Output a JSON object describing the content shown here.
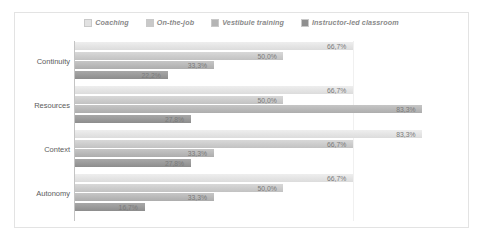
{
  "chart_data": {
    "type": "bar",
    "orientation": "horizontal",
    "title": "",
    "xlabel": "",
    "ylabel": "",
    "grid": true,
    "legend_position": "top",
    "xlim": [
      0,
      100
    ],
    "decimal_separator": ",",
    "value_suffix": "%",
    "categories": [
      "Continuity",
      "Resources",
      "Context",
      "Autonomy"
    ],
    "series": [
      {
        "name": "Coaching",
        "color": "#e2e2e2",
        "values": [
          66.7,
          66.7,
          83.3,
          66.7
        ],
        "labels": [
          "66,7%",
          "66,7%",
          "83,3%",
          "66,7%"
        ]
      },
      {
        "name": "On-the-job",
        "color": "#c9c9c9",
        "values": [
          50.0,
          50.0,
          66.7,
          50.0
        ],
        "labels": [
          "50,0%",
          "50,0%",
          "66,7%",
          "50,0%"
        ]
      },
      {
        "name": "Vestibule training",
        "color": "#b4b4b4",
        "values": [
          33.3,
          83.3,
          33.3,
          33.3
        ],
        "labels": [
          "33,3%",
          "83,3%",
          "33,3%",
          "33,3%"
        ]
      },
      {
        "name": "Instructor-led classroom",
        "color": "#8f8f8f",
        "values": [
          22.2,
          27.8,
          27.8,
          16.7
        ],
        "labels": [
          "22,2%",
          "27,8%",
          "27,8%",
          "16,7%"
        ]
      }
    ]
  }
}
